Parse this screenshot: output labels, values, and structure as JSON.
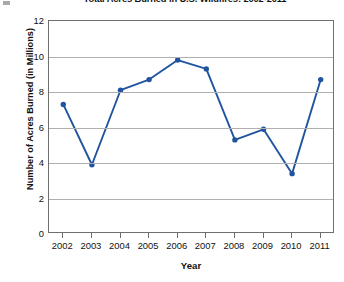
{
  "chart_data": {
    "type": "line",
    "title": "Total Acres Burned in U.S. Wildfires: 2002-2011",
    "xlabel": "Year",
    "ylabel": "Number of Acres Burned (in Millions)",
    "categories": [
      "2002",
      "2003",
      "2004",
      "2005",
      "2006",
      "2007",
      "2008",
      "2009",
      "2010",
      "2011"
    ],
    "values": [
      7.3,
      3.9,
      8.1,
      8.7,
      9.8,
      9.3,
      5.3,
      5.9,
      3.4,
      8.7
    ],
    "series": [
      {
        "name": "Acres Burned",
        "values": [
          7.3,
          3.9,
          8.1,
          8.7,
          9.8,
          9.3,
          5.3,
          5.9,
          3.4,
          8.7
        ]
      }
    ],
    "ylim": [
      0,
      12
    ],
    "yticks": [
      0,
      2,
      4,
      6,
      8,
      10,
      12
    ],
    "ytick_labels": [
      "0",
      "2",
      "4",
      "6",
      "8",
      "10",
      "12"
    ],
    "grid": "horizontal",
    "legend": "none",
    "marker": "circle",
    "colors": {
      "line": "#21549f",
      "marker": "#21549f",
      "gridline": "#b0b0b0",
      "axis": "#6f6f6f",
      "text": "#111111",
      "background": "#ffffff"
    }
  }
}
